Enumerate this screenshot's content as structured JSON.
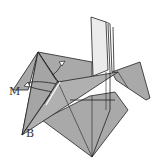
{
  "diagram": {
    "type": "origami-fold-step",
    "labels": [
      {
        "id": "M",
        "text": "M",
        "x": 10,
        "y": 92
      },
      {
        "id": "B",
        "text": "B",
        "x": 26,
        "y": 130
      }
    ],
    "arrows": [
      {
        "id": "arrow-up-right",
        "description": "curved arrow pointing up-right near top-left flap"
      },
      {
        "id": "arrow-curl-left",
        "description": "curved arrow wrapping around left flap"
      }
    ],
    "colors": {
      "paper": "#a9a9a9",
      "paper_light": "#e8e8e8",
      "line": "#222222",
      "background": "#ffffff"
    }
  }
}
